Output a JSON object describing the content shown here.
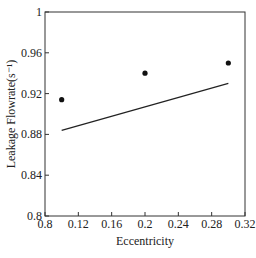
{
  "chart_data": {
    "type": "scatter",
    "title": "",
    "xlabel": "Eccentricity",
    "ylabel": "Leakage Flowrate(s⁻¹)",
    "xlim": [
      0.08,
      0.32
    ],
    "ylim": [
      0.8,
      1.0
    ],
    "grid": false,
    "legend": null,
    "x_ticks": [
      0.08,
      0.12,
      0.16,
      0.2,
      0.24,
      0.28,
      0.32
    ],
    "x_tick_labels": [
      "0.8",
      "0.12",
      "0.16",
      "0.2",
      "0.24",
      "0.28",
      "0.32"
    ],
    "y_ticks": [
      0.8,
      0.84,
      0.88,
      0.92,
      0.96,
      1.0
    ],
    "y_tick_labels": [
      "0.8",
      "0.84",
      "0.88",
      "0.92",
      "0.96",
      "1"
    ],
    "series": [
      {
        "name": "measured",
        "type": "scatter",
        "marker": "filled-circle",
        "x": [
          0.1,
          0.2,
          0.3
        ],
        "y": [
          0.914,
          0.94,
          0.95
        ]
      },
      {
        "name": "fitted",
        "type": "line",
        "x": [
          0.1,
          0.3
        ],
        "y": [
          0.884,
          0.93
        ]
      }
    ]
  },
  "labels": {
    "xlabel": "Eccentricity",
    "ylabel": "Leakage Flowrate(s⁻¹)",
    "caption": "图 3 …"
  }
}
